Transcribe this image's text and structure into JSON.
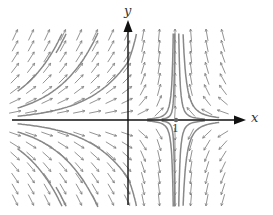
{
  "diagram": {
    "type": "phase-portrait",
    "axes": {
      "x_label": "x",
      "y_label": "y",
      "tick_labels": [
        "1"
      ],
      "origin_px": [
        128,
        120
      ],
      "unit_px": 48
    },
    "equilibrium_points": [
      {
        "label": "1",
        "x": 1,
        "y": 0
      }
    ],
    "colors": {
      "axis": "#111111",
      "arrows": "#777777",
      "trajectories": "#888888",
      "background": "#ffffff"
    },
    "field_extent_px": {
      "x_min": 15,
      "x_max": 235,
      "y_min": 35,
      "y_max": 205
    }
  },
  "chart_data": {
    "type": "vector-field",
    "title": "",
    "xlabel": "x",
    "ylabel": "y",
    "annotations": [
      "1"
    ],
    "equilibria": [
      [
        0,
        0
      ],
      [
        1,
        0
      ]
    ]
  }
}
